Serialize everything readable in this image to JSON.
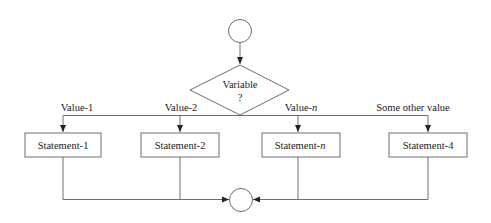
{
  "diagram": {
    "type": "switch-case flowchart",
    "start_node": {
      "shape": "circle",
      "label": ""
    },
    "end_node": {
      "shape": "circle",
      "label": ""
    },
    "decision": {
      "line1": "Variable",
      "line2": "?"
    },
    "branches": [
      {
        "condition_prefix": "Value-",
        "condition_suffix": "1",
        "statement_prefix": "Statement-",
        "statement_suffix": "1"
      },
      {
        "condition_prefix": "Value-",
        "condition_suffix": "2",
        "statement_prefix": "Statement-",
        "statement_suffix": "2"
      },
      {
        "condition_prefix": "Value-",
        "condition_suffix": "n",
        "statement_prefix": "Statement-",
        "statement_suffix": "n"
      },
      {
        "condition_prefix": "Some other value",
        "condition_suffix": "",
        "statement_prefix": "Statement-",
        "statement_suffix": "4"
      }
    ],
    "colors": {
      "stroke": "#6e6e6e",
      "text": "#222222",
      "background": "#ffffff"
    }
  }
}
